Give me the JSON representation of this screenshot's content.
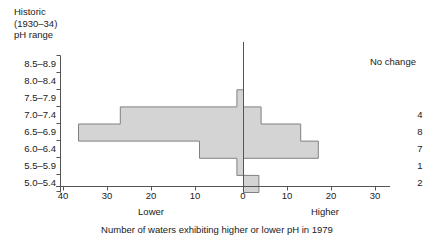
{
  "header": {
    "title_lines": "Historic\n(1930–34)\npH range",
    "no_change_label": "No change"
  },
  "caption": "Number of waters exhibiting higher or lower pH in 1979",
  "axis": {
    "lower_label": "Lower",
    "higher_label": "Higher",
    "xticks": [
      "40",
      "30",
      "20",
      "10",
      "0",
      "10",
      "20",
      "30"
    ]
  },
  "chart_data": {
    "type": "bar",
    "orientation": "horizontal-diverging",
    "title": "",
    "xlabel": "Number of waters exhibiting higher or lower pH in 1979",
    "ylabel": "Historic (1930–34) pH range",
    "xlim": [
      -40,
      35
    ],
    "grid": false,
    "categories": [
      "8.5–8.9",
      "8.0–8.4",
      "7.5–7.9",
      "7.0–7.4",
      "6.5–6.9",
      "6.0–6.4",
      "5.5–5.9",
      "5.0–5.4"
    ],
    "series": [
      {
        "name": "Lower pH in 1979",
        "values": [
          0,
          0,
          1.5,
          28,
          37.5,
          10,
          1.5,
          0
        ]
      },
      {
        "name": "Higher pH in 1979",
        "values": [
          0,
          0,
          0,
          4,
          13,
          17,
          0,
          3.5
        ]
      }
    ],
    "no_change": [
      "",
      "",
      "",
      "4",
      "8",
      "7",
      "1",
      "2"
    ],
    "bar_fill": "#d4d4d4",
    "bar_stroke": "#808080",
    "axis_color": "#555555"
  },
  "no_change_rows": [
    {
      "label": "",
      "value": ""
    },
    {
      "label": "",
      "value": ""
    },
    {
      "label": "",
      "value": ""
    },
    {
      "label": "7.0–7.4",
      "value": "4"
    },
    {
      "label": "6.5–6.9",
      "value": "8"
    },
    {
      "label": "6.0–6.4",
      "value": "7"
    },
    {
      "label": "5.5–5.9",
      "value": "1"
    },
    {
      "label": "5.0–5.4",
      "value": "2"
    }
  ]
}
